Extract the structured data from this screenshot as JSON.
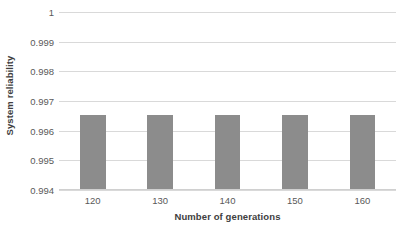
{
  "chart_data": {
    "type": "bar",
    "title": "",
    "categories": [
      "120",
      "130",
      "140",
      "150",
      "160"
    ],
    "values": [
      0.99654,
      0.99654,
      0.99654,
      0.99654,
      0.99654
    ],
    "series": [
      {
        "name": "System reliability",
        "values": [
          0.99654,
          0.99654,
          0.99654,
          0.99654,
          0.99654
        ]
      }
    ],
    "xlabel": "Number of generations",
    "ylabel": "System reliability",
    "ylim": [
      0.994,
      1
    ],
    "ytick_labels": [
      "1",
      "0.999",
      "0.998",
      "0.997",
      "0.996",
      "0.995",
      "0.994"
    ],
    "ytick_values": [
      1,
      0.999,
      0.998,
      0.997,
      0.996,
      0.995,
      0.994
    ],
    "grid": true,
    "grid_axis": "y",
    "legend": false,
    "legend_position": "none",
    "bar_color": "#8c8c8c",
    "gridline_color": "#d9d9d9",
    "background_color": "#ffffff",
    "axis_label_color": "#404040",
    "tick_label_color": "#595959"
  }
}
